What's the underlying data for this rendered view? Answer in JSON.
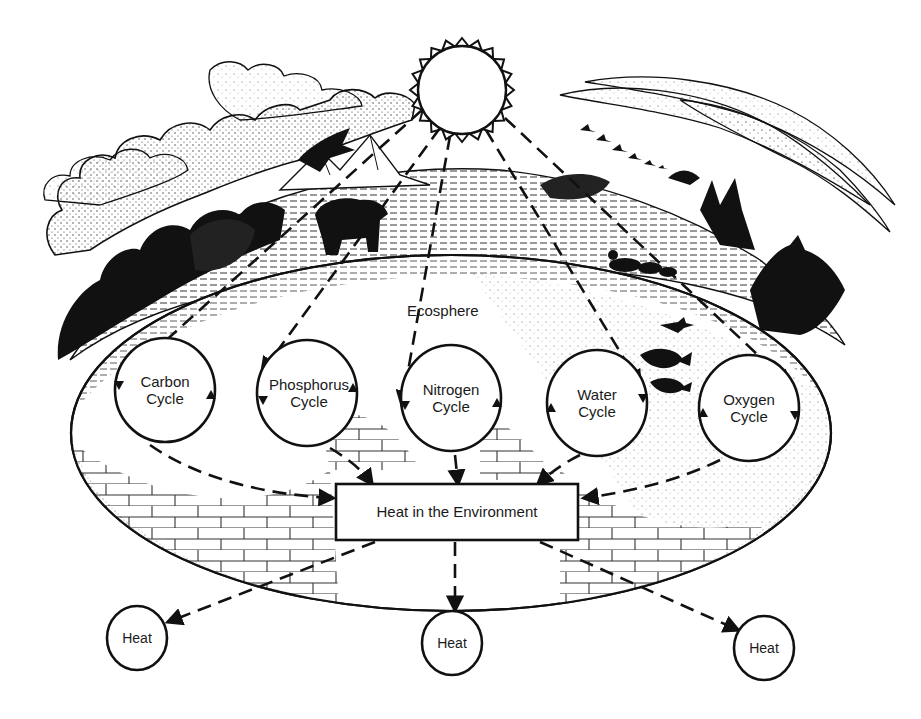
{
  "diagram": {
    "title": "",
    "source": {
      "name": "sun",
      "icon": "sun-icon"
    },
    "region_label": "Ecosphere",
    "cycles": [
      {
        "label_line1": "Carbon",
        "label_line2": "Cycle",
        "cx": 165,
        "cy": 390
      },
      {
        "label_line1": "Phosphorus",
        "label_line2": "Cycle",
        "cx": 307,
        "cy": 393
      },
      {
        "label_line1": "Nitrogen",
        "label_line2": "Cycle",
        "cx": 451,
        "cy": 398
      },
      {
        "label_line1": "Water",
        "label_line2": "Cycle",
        "cx": 597,
        "cy": 403
      },
      {
        "label_line1": "Oxygen",
        "label_line2": "Cycle",
        "cx": 749,
        "cy": 408
      }
    ],
    "sink": {
      "label": "Heat in the Environment"
    },
    "outputs": [
      {
        "label": "Heat",
        "cx": 137,
        "cy": 638
      },
      {
        "label": "Heat",
        "cx": 452,
        "cy": 643
      },
      {
        "label": "Heat",
        "cx": 764,
        "cy": 648
      }
    ],
    "illustration_elements": [
      "clouds",
      "eagle",
      "mountains",
      "bear",
      "trees",
      "ducks",
      "geese",
      "fish",
      "lizard",
      "rocks",
      "grass"
    ],
    "edges": [
      {
        "from": "sun",
        "to": "Carbon Cycle",
        "style": "dashed"
      },
      {
        "from": "sun",
        "to": "Phosphorus Cycle",
        "style": "dashed"
      },
      {
        "from": "sun",
        "to": "Nitrogen Cycle",
        "style": "dashed"
      },
      {
        "from": "sun",
        "to": "Water Cycle",
        "style": "dashed"
      },
      {
        "from": "sun",
        "to": "Oxygen Cycle",
        "style": "dashed"
      },
      {
        "from": "Carbon Cycle",
        "to": "Heat in the Environment",
        "style": "dashed"
      },
      {
        "from": "Phosphorus Cycle",
        "to": "Heat in the Environment",
        "style": "dashed"
      },
      {
        "from": "Nitrogen Cycle",
        "to": "Heat in the Environment",
        "style": "dashed"
      },
      {
        "from": "Water Cycle",
        "to": "Heat in the Environment",
        "style": "dashed"
      },
      {
        "from": "Oxygen Cycle",
        "to": "Heat in the Environment",
        "style": "dashed"
      },
      {
        "from": "Heat in the Environment",
        "to": "Heat (left)",
        "style": "dashed"
      },
      {
        "from": "Heat in the Environment",
        "to": "Heat (center)",
        "style": "dashed"
      },
      {
        "from": "Heat in the Environment",
        "to": "Heat (right)",
        "style": "dashed"
      }
    ],
    "colors": {
      "ink": "#111111",
      "paper": "#ffffff",
      "stipple": "#555555"
    }
  }
}
